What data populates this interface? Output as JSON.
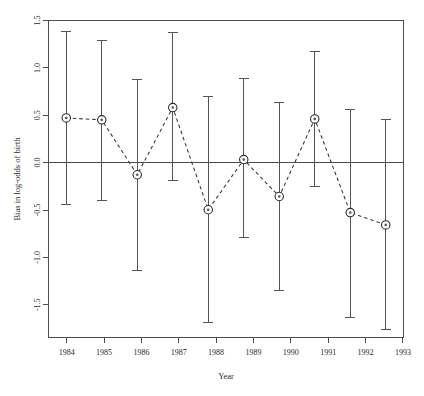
{
  "chart_data": {
    "type": "scatter",
    "title": "",
    "subtitle": "",
    "xlabel": "Year",
    "ylabel": "Bias in log-odds of birth",
    "categories": [
      "1984",
      "1985",
      "1986",
      "1987",
      "1988",
      "1989",
      "1990",
      "1991",
      "1992",
      "1993"
    ],
    "x": [
      1984,
      1985,
      1986,
      1987,
      1988,
      1989,
      1990,
      1991,
      1992,
      1993
    ],
    "values": [
      0.47,
      0.45,
      -0.13,
      0.58,
      -0.5,
      0.03,
      -0.36,
      0.46,
      -0.53,
      -0.66
    ],
    "error_low": [
      -0.44,
      -0.4,
      -1.14,
      -0.19,
      -1.69,
      -0.79,
      -1.35,
      -0.25,
      -1.64,
      -1.77
    ],
    "error_high": [
      1.38,
      1.29,
      0.88,
      1.37,
      0.7,
      0.89,
      0.63,
      1.17,
      0.56,
      0.45
    ],
    "series": [
      {
        "name": "Bias in log-odds of birth",
        "values": [
          0.47,
          0.45,
          -0.13,
          0.58,
          -0.5,
          0.03,
          -0.36,
          0.46,
          -0.53,
          -0.66
        ]
      }
    ],
    "xlim": [
      1983.5,
      1993.5
    ],
    "ylim": [
      -1.85,
      1.5
    ],
    "yticks": [
      1.5,
      1.0,
      0.5,
      0.0,
      -0.5,
      -1.0,
      -1.5
    ],
    "ytick_labels": [
      "1.5",
      "1.0",
      "0.5",
      "0.0",
      "-0.5",
      "-1.0",
      "-1.5"
    ],
    "xticks": [
      1984,
      1985,
      1986,
      1987,
      1988,
      1989,
      1990,
      1991,
      1992,
      1993
    ],
    "xtick_labels": [
      "1984",
      "1985",
      "1986",
      "1987",
      "1988",
      "1989",
      "1990",
      "1991",
      "1992",
      "1993"
    ],
    "grid": false,
    "legend": false,
    "legend_position": "none",
    "reference_line_y": 0.0,
    "marker": "circle-with-dot",
    "line_style": "dashed",
    "errorbar_style": "vertical-with-caps",
    "colors": {
      "marker_edge": "#2b2b2b",
      "marker_fill": "#ffffff",
      "marker_dot": "#5a5a5a",
      "line": "#3a3a3a",
      "errorbar": "#555555",
      "axis": "#4d4d4d",
      "text": "#2b2b2b",
      "background": "#ffffff"
    }
  }
}
